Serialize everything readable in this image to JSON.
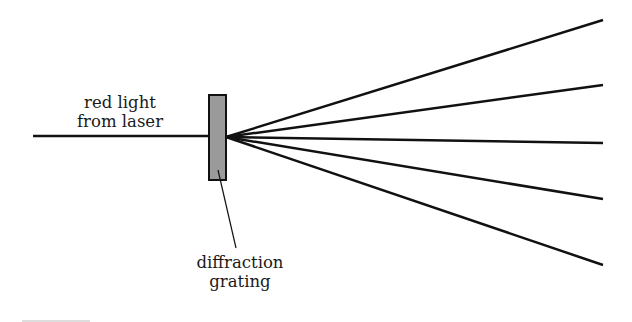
{
  "labels": {
    "source_line1": "red light",
    "source_line2": "from laser",
    "grating_line1": "diffraction",
    "grating_line2": "grating"
  },
  "colors": {
    "line": "#111111",
    "grating_fill": "#9a9a9a",
    "background": "#ffffff"
  },
  "geometry": {
    "incoming_beam": {
      "x1": 33,
      "y1": 136,
      "x2": 209,
      "y2": 136
    },
    "grating": {
      "x": 209,
      "y": 95,
      "w": 17,
      "h": 85
    },
    "origin": {
      "x": 226,
      "y": 137
    },
    "ray_endpoints_y": [
      20,
      85,
      143,
      199,
      265
    ],
    "ray_end_x": 603,
    "pointer": {
      "x1": 218,
      "y1": 170,
      "x2": 236,
      "y2": 248
    }
  }
}
